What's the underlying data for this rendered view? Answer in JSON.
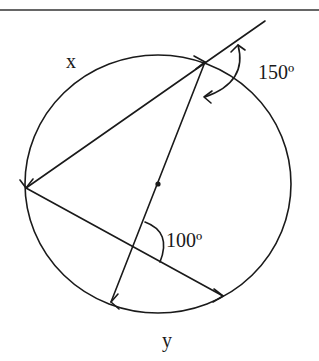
{
  "diagram": {
    "type": "circle-geometry",
    "circle": {
      "cx": 158,
      "cy": 184,
      "rx": 133,
      "ry": 129
    },
    "points": {
      "A_top": [
        205,
        62
      ],
      "B_left": [
        26,
        188
      ],
      "C_bottom_left": [
        111,
        302
      ],
      "D_bottom_right": [
        223,
        296
      ],
      "center": [
        158,
        184
      ],
      "chord_intersection": [
        133,
        247
      ],
      "secant_end": [
        265,
        21
      ]
    },
    "labels": {
      "arc_x": "x",
      "arc_y": "y",
      "angle_exterior": "150º",
      "angle_interior": "100º"
    }
  }
}
